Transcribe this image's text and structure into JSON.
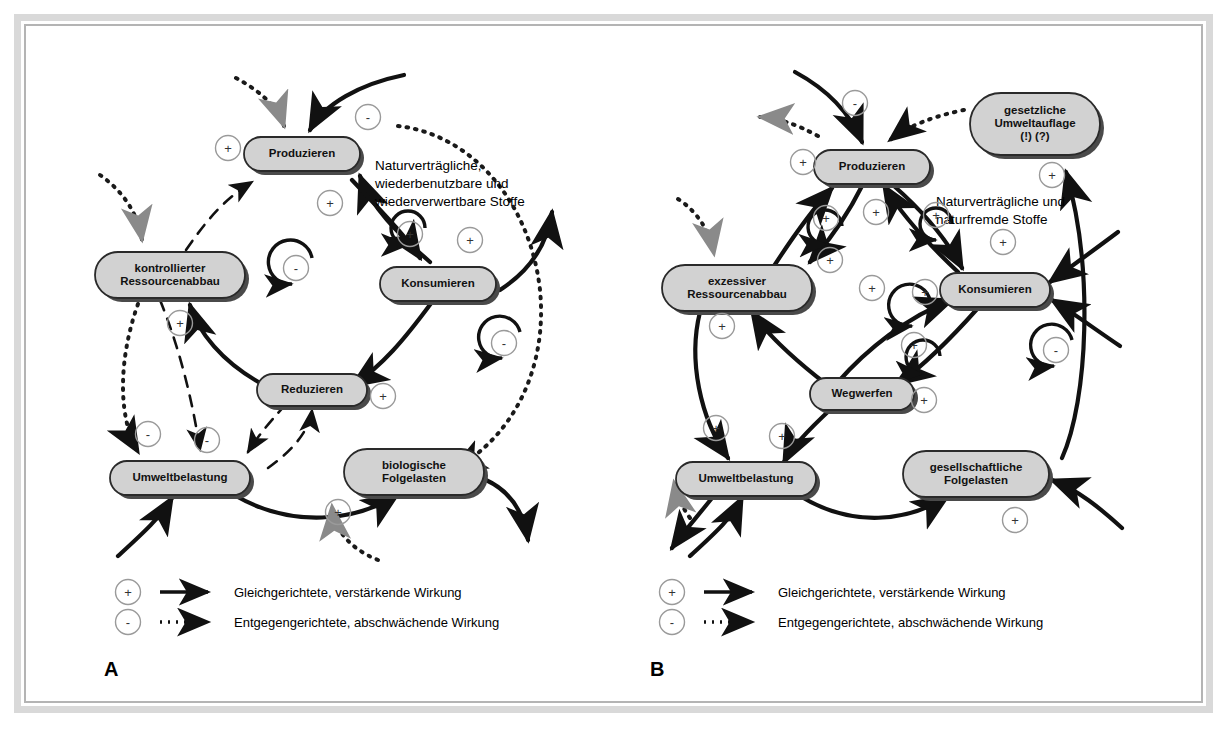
{
  "figure": {
    "type": "causal-loop-diagram",
    "language": "de",
    "panels": [
      {
        "letter": "A",
        "title_implied": "nachhaltiger Kreislauf",
        "nodes": [
          {
            "id": "produzieren",
            "label": "Produzieren",
            "lines": [
              "Produzieren"
            ],
            "x": 302,
            "y": 154,
            "w": 116,
            "h": 34
          },
          {
            "id": "kontrollierter-ressourcenabbau",
            "label": "kontrollierter Ressourcenabbau",
            "lines": [
              "kontrollierter",
              "Ressourcenabbau"
            ],
            "x": 170,
            "y": 275,
            "w": 150,
            "h": 46
          },
          {
            "id": "konsumieren",
            "label": "Konsumieren",
            "lines": [
              "Konsumieren"
            ],
            "x": 438,
            "y": 284,
            "w": 116,
            "h": 34
          },
          {
            "id": "reduzieren",
            "label": "Reduzieren",
            "lines": [
              "Reduzieren"
            ],
            "x": 312,
            "y": 390,
            "w": 110,
            "h": 32
          },
          {
            "id": "umweltbelastung",
            "label": "Umweltbelastung",
            "lines": [
              "Umweltbelastung"
            ],
            "x": 180,
            "y": 478,
            "w": 140,
            "h": 34
          },
          {
            "id": "biologische-folgelasten",
            "label": "biologische Folgelasten",
            "lines": [
              "biologische",
              "Folgelasten"
            ],
            "x": 414,
            "y": 472,
            "w": 140,
            "h": 46
          }
        ],
        "annotation": {
          "id": "anno-a",
          "lines": [
            "Naturverträgliche,",
            "wiederbenutzbare und",
            "wiederverwertbare Stoffe"
          ],
          "x": 375,
          "y": 170
        },
        "signs": [
          {
            "sign": "+",
            "x": 228,
            "y": 148
          },
          {
            "sign": "-",
            "x": 368,
            "y": 117
          },
          {
            "sign": "+",
            "x": 330,
            "y": 203
          },
          {
            "sign": "+",
            "x": 410,
            "y": 234
          },
          {
            "sign": "+",
            "x": 470,
            "y": 240
          },
          {
            "sign": "-",
            "x": 296,
            "y": 268
          },
          {
            "sign": "+",
            "x": 180,
            "y": 323
          },
          {
            "sign": "-",
            "x": 504,
            "y": 343
          },
          {
            "sign": "+",
            "x": 383,
            "y": 396
          },
          {
            "sign": "-",
            "x": 148,
            "y": 434
          },
          {
            "sign": "-",
            "x": 207,
            "y": 440
          },
          {
            "sign": "+",
            "x": 338,
            "y": 512
          }
        ],
        "legend": [
          {
            "sign": "+",
            "style": "solid",
            "text": "Gleichgerichtete, verstärkende Wirkung"
          },
          {
            "sign": "-",
            "style": "dotted",
            "text": "Entgegengerichtete, abschwächende Wirkung"
          }
        ],
        "legend_origin": {
          "x": 128,
          "y": 592
        }
      },
      {
        "letter": "B",
        "title_implied": "nicht nachhaltiger Kreislauf",
        "nodes": [
          {
            "id": "produzieren-b",
            "label": "Produzieren",
            "lines": [
              "Produzieren"
            ],
            "x": 872,
            "y": 167,
            "w": 116,
            "h": 34
          },
          {
            "id": "gesetzliche-umweltauflage",
            "label": "gesetzliche Umweltauflage (!) (?)",
            "lines": [
              "gesetzliche",
              "Umweltauflage",
              "(!) (?)"
            ],
            "x": 1035,
            "y": 124,
            "w": 130,
            "h": 62
          },
          {
            "id": "exzessiver-ressourcenabbau",
            "label": "exzessiver Ressourcenabbau",
            "lines": [
              "exzessiver",
              "Ressourcenabbau"
            ],
            "x": 737,
            "y": 288,
            "w": 150,
            "h": 46
          },
          {
            "id": "konsumieren-b",
            "label": "Konsumieren",
            "lines": [
              "Konsumieren"
            ],
            "x": 995,
            "y": 290,
            "w": 110,
            "h": 34
          },
          {
            "id": "wegwerfen",
            "label": "Wegwerfen",
            "lines": [
              "Wegwerfen"
            ],
            "x": 862,
            "y": 394,
            "w": 104,
            "h": 32
          },
          {
            "id": "umweltbelastung-b",
            "label": "Umweltbelastung",
            "lines": [
              "Umweltbelastung"
            ],
            "x": 746,
            "y": 479,
            "w": 140,
            "h": 34
          },
          {
            "id": "gesellschaftliche-folgelasten",
            "label": "gesellschaftliche Folgelasten",
            "lines": [
              "gesellschaftliche",
              "Folgelasten"
            ],
            "x": 976,
            "y": 474,
            "w": 146,
            "h": 46
          }
        ],
        "annotation": {
          "id": "anno-b",
          "lines": [
            "Naturverträgliche und",
            "naturfremde Stoffe"
          ],
          "x": 936,
          "y": 206
        },
        "signs": [
          {
            "sign": "-",
            "x": 855,
            "y": 103
          },
          {
            "sign": "+",
            "x": 803,
            "y": 162
          },
          {
            "sign": "+",
            "x": 1052,
            "y": 175
          },
          {
            "sign": "+",
            "x": 826,
            "y": 218
          },
          {
            "sign": "+",
            "x": 876,
            "y": 212
          },
          {
            "sign": "+",
            "x": 936,
            "y": 215
          },
          {
            "sign": "+",
            "x": 830,
            "y": 260
          },
          {
            "sign": "+",
            "x": 1003,
            "y": 242
          },
          {
            "sign": "+",
            "x": 872,
            "y": 288
          },
          {
            "sign": "+",
            "x": 925,
            "y": 292
          },
          {
            "sign": "+",
            "x": 722,
            "y": 326
          },
          {
            "sign": "+",
            "x": 914,
            "y": 345
          },
          {
            "sign": "-",
            "x": 1056,
            "y": 350
          },
          {
            "sign": "+",
            "x": 716,
            "y": 428
          },
          {
            "sign": "+",
            "x": 782,
            "y": 436
          },
          {
            "sign": "+",
            "x": 924,
            "y": 400
          },
          {
            "sign": "+",
            "x": 1015,
            "y": 520
          }
        ],
        "legend": [
          {
            "sign": "+",
            "style": "solid",
            "text": "Gleichgerichtete, verstärkende Wirkung"
          },
          {
            "sign": "-",
            "style": "dotted",
            "text": "Entgegengerichtete, abschwächende Wirkung"
          }
        ],
        "legend_origin": {
          "x": 672,
          "y": 592
        }
      }
    ],
    "letters": [
      {
        "text": "A",
        "x": 104,
        "y": 676
      },
      {
        "text": "B",
        "x": 650,
        "y": 676
      }
    ],
    "colors": {
      "frame_outer": "#d9d9d9",
      "frame_inner": "#b4b4b4",
      "node_fill": "#d2d2d2",
      "node_stroke": "#2a2a2a",
      "node_shadow": "#4a4a4a",
      "arrow_solid": "#111111",
      "arrow_dotted": "#1a1a1a",
      "arrow_gray": "#8a8a8a",
      "sign_circle": "#9a9a9a",
      "page_bg": "#ffffff"
    }
  }
}
